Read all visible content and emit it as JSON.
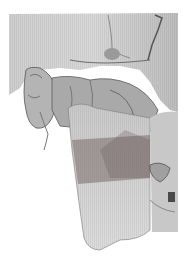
{
  "image": {
    "description": "3D surface rendering of skull and mandible (lateral view) with a semi-transparent shaded region over the mandibular ramus/body",
    "caption_faint": "",
    "colors": {
      "background": "#ffffff",
      "bone_light": "#d9d9d9",
      "bone_mid": "#a8a8a8",
      "bone_dark": "#5a5a5a",
      "overlay_region": "#8a7a7a"
    }
  }
}
